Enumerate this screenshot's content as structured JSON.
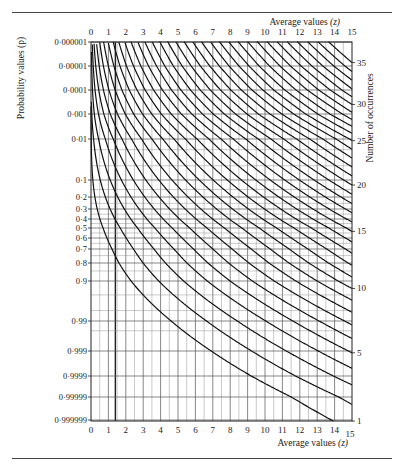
{
  "chart_data": {
    "type": "line",
    "title": "",
    "top_xlabel": "Average values",
    "top_xlabel_var": "(z)",
    "bottom_xlabel": "Average values",
    "bottom_xlabel_var": "(z)",
    "ylabel_left": "Probability values (p)",
    "ylabel_right": "Number of occurrences",
    "x_ticks": [
      0,
      1,
      2,
      3,
      4,
      5,
      6,
      7,
      8,
      9,
      10,
      11,
      12,
      13,
      14,
      15
    ],
    "xlim": [
      0,
      15
    ],
    "y_ticks_left": [
      {
        "label": "0·000001",
        "p": 1e-06,
        "y": 42
      },
      {
        "label": "0·00001",
        "p": 1e-05,
        "y": 66
      },
      {
        "label": "0·0001",
        "p": 0.0001,
        "y": 90
      },
      {
        "label": "0·001",
        "p": 0.001,
        "y": 114
      },
      {
        "label": "0·01",
        "p": 0.01,
        "y": 139
      },
      {
        "label": "0·1",
        "p": 0.1,
        "y": 180
      },
      {
        "label": "0·2",
        "p": 0.2,
        "y": 197
      },
      {
        "label": "0·3",
        "p": 0.3,
        "y": 209
      },
      {
        "label": "0·4",
        "p": 0.4,
        "y": 219
      },
      {
        "label": "0·5",
        "p": 0.5,
        "y": 228
      },
      {
        "label": "0·6",
        "p": 0.6,
        "y": 238
      },
      {
        "label": "0·7",
        "p": 0.7,
        "y": 249
      },
      {
        "label": "0·8",
        "p": 0.8,
        "y": 263
      },
      {
        "label": "0·9",
        "p": 0.9,
        "y": 281
      },
      {
        "label": "0·99",
        "p": 0.99,
        "y": 321
      },
      {
        "label": "0·999",
        "p": 0.999,
        "y": 351
      },
      {
        "label": "0·9999",
        "p": 0.9999,
        "y": 376
      },
      {
        "label": "0·99999",
        "p": 0.99999,
        "y": 397
      },
      {
        "label": "0·999999",
        "p": 0.999999,
        "y": 420
      }
    ],
    "extra_gridlines_p": [
      0.02,
      0.05,
      0.15,
      0.25,
      0.35,
      0.45,
      0.55,
      0.65,
      0.75,
      0.85,
      0.95,
      0.98,
      0.995
    ],
    "right_axis_ticks": [
      1,
      5,
      10,
      15,
      20,
      25,
      30,
      35
    ],
    "curves_c": [
      1,
      2,
      3,
      4,
      5,
      6,
      7,
      8,
      9,
      10,
      11,
      12,
      13,
      14,
      15,
      16,
      17,
      18,
      19,
      20,
      21,
      22,
      23,
      24,
      25,
      26,
      27,
      28,
      29,
      30,
      31,
      32,
      33,
      34,
      35
    ],
    "highlight_vertical_z": 1.4,
    "grid": true
  },
  "labels": {
    "top_axis_title": "Average values",
    "top_axis_var": "(z)",
    "bottom_axis_title": "Average values",
    "bottom_axis_var": "(z)",
    "left_axis_title": "Probability values (p)",
    "right_axis_title": "Number of occurrences"
  }
}
